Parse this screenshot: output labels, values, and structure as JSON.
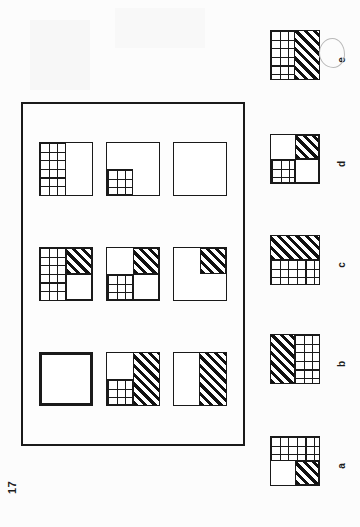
{
  "page": {
    "number": "17",
    "kind": "iq-test-matrix-puzzle",
    "background_color": "#fcfcfc",
    "ink_color": "#1a1a1a"
  },
  "matrix": {
    "name": "3x3-matrix-problem",
    "rows": 3,
    "cols": 3,
    "cells": [
      {
        "id": "cell-1",
        "description": "left half grid, right half blank",
        "missing": false,
        "regions": [
          {
            "name": "left-half",
            "fill": "grid"
          },
          {
            "name": "right-half",
            "fill": "white"
          }
        ]
      },
      {
        "id": "cell-2",
        "description": "left half grid, top-right hatched, bottom-right blank",
        "missing": false,
        "regions": [
          {
            "name": "left-half",
            "fill": "grid"
          },
          {
            "name": "top-right-quadrant",
            "fill": "hatch"
          },
          {
            "name": "bottom-right-quadrant",
            "fill": "white"
          }
        ]
      },
      {
        "id": "cell-3",
        "description": "missing cell, empty square with heavy border",
        "missing": true,
        "regions": [
          {
            "name": "whole",
            "fill": "white"
          }
        ]
      },
      {
        "id": "cell-4",
        "description": "bottom-left quadrant grid, remainder blank",
        "missing": false,
        "regions": [
          {
            "name": "bottom-left-quadrant",
            "fill": "grid"
          },
          {
            "name": "remainder",
            "fill": "white"
          }
        ]
      },
      {
        "id": "cell-5",
        "description": "top-right hatched, bottom-left grid, rest blank",
        "missing": false,
        "regions": [
          {
            "name": "top-left-quadrant",
            "fill": "white"
          },
          {
            "name": "top-right-quadrant",
            "fill": "hatch"
          },
          {
            "name": "bottom-left-quadrant",
            "fill": "grid"
          },
          {
            "name": "bottom-right-quadrant",
            "fill": "white"
          }
        ]
      },
      {
        "id": "cell-6",
        "description": "right half hatched, bottom-left quadrant grid, top-left blank",
        "missing": false,
        "regions": [
          {
            "name": "right-half",
            "fill": "hatch"
          },
          {
            "name": "top-left-quadrant",
            "fill": "white"
          },
          {
            "name": "bottom-left-quadrant",
            "fill": "grid"
          }
        ]
      },
      {
        "id": "cell-7",
        "description": "entirely blank square",
        "missing": false,
        "regions": [
          {
            "name": "whole",
            "fill": "white"
          }
        ]
      },
      {
        "id": "cell-8",
        "description": "top-right quadrant hatched, remainder blank",
        "missing": false,
        "regions": [
          {
            "name": "top-right-quadrant",
            "fill": "hatch"
          },
          {
            "name": "remainder",
            "fill": "white"
          }
        ]
      },
      {
        "id": "cell-9",
        "description": "left half blank, right half hatched",
        "missing": false,
        "regions": [
          {
            "name": "left-half",
            "fill": "white"
          },
          {
            "name": "right-half",
            "fill": "hatch"
          }
        ]
      }
    ]
  },
  "options": {
    "name": "answer-options",
    "selected": "e",
    "selection_mark": "hand-drawn-pencil-circle",
    "items": [
      {
        "label": "a",
        "description": "top half grid, bottom-left blank, bottom-right hatched",
        "regions": [
          {
            "name": "top-half",
            "fill": "grid"
          },
          {
            "name": "bottom-left-quadrant",
            "fill": "white"
          },
          {
            "name": "bottom-right-quadrant",
            "fill": "hatch"
          }
        ]
      },
      {
        "label": "b",
        "description": "left half hatched, right half grid",
        "regions": [
          {
            "name": "left-half",
            "fill": "hatch"
          },
          {
            "name": "right-half",
            "fill": "grid"
          }
        ]
      },
      {
        "label": "c",
        "description": "top half hatched, bottom half grid",
        "regions": [
          {
            "name": "top-half",
            "fill": "hatch"
          },
          {
            "name": "bottom-half",
            "fill": "grid"
          }
        ]
      },
      {
        "label": "d",
        "description": "top-left blank, top-right hatched, bottom-left grid, bottom-right blank",
        "regions": [
          {
            "name": "top-left-quadrant",
            "fill": "white"
          },
          {
            "name": "top-right-quadrant",
            "fill": "hatch"
          },
          {
            "name": "bottom-left-quadrant",
            "fill": "grid"
          },
          {
            "name": "bottom-right-quadrant",
            "fill": "white"
          }
        ]
      },
      {
        "label": "e",
        "description": "left half grid, right half hatched",
        "regions": [
          {
            "name": "left-half",
            "fill": "grid"
          },
          {
            "name": "right-half",
            "fill": "hatch"
          }
        ]
      }
    ]
  }
}
